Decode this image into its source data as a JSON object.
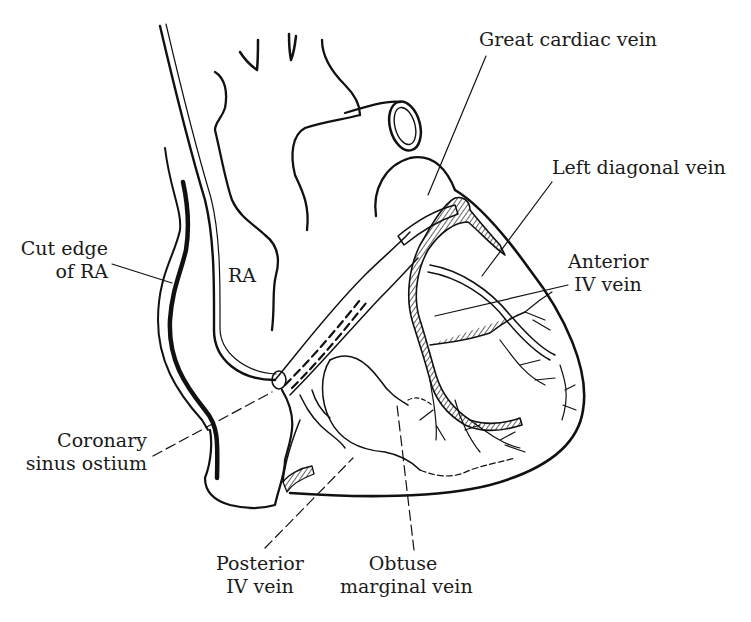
{
  "diagram": {
    "stroke_color": "#111111",
    "background_color": "#ffffff",
    "labels": [
      {
        "id": "great-cardiac-vein",
        "lines": [
          "Great cardiac vein"
        ]
      },
      {
        "id": "left-diagonal-vein",
        "lines": [
          "Left diagonal vein"
        ]
      },
      {
        "id": "anterior-iv-vein",
        "lines": [
          "Anterior",
          "IV vein"
        ]
      },
      {
        "id": "cut-edge-of-ra",
        "lines": [
          "Cut edge",
          "of RA"
        ]
      },
      {
        "id": "ra",
        "lines": [
          "RA"
        ]
      },
      {
        "id": "coronary-sinus-ostium",
        "lines": [
          "Coronary",
          "sinus ostium"
        ]
      },
      {
        "id": "posterior-iv-vein",
        "lines": [
          "Posterior",
          "IV vein"
        ]
      },
      {
        "id": "obtuse-marginal-vein",
        "lines": [
          "Obtuse",
          "marginal vein"
        ]
      }
    ]
  }
}
